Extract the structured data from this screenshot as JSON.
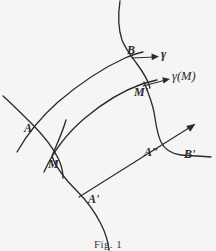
{
  "figure": {
    "caption": "Fig. 1",
    "background_color": "#f5f5f6",
    "ink_color": "#2b2a2c",
    "labels": {
      "point_b": "B",
      "gamma": "γ",
      "gamma_of_m": "γ(M)",
      "point_m_prime": "M'",
      "point_a": "A",
      "point_m": "M",
      "point_a_double_prime": "A″",
      "point_b_prime": "B'",
      "point_a_prime": "A'"
    }
  }
}
